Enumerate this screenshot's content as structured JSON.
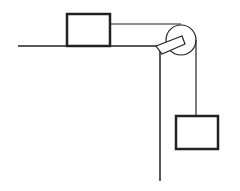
{
  "diagram": {
    "stroke_color": "#222222",
    "background": "#ffffff",
    "table": {
      "surface": {
        "x1": 18,
        "y1": 46,
        "x2": 160,
        "y2": 46
      },
      "edge": {
        "x1": 160,
        "y1": 46,
        "x2": 160,
        "y2": 181
      }
    },
    "block_on_table": {
      "x": 67,
      "y": 14,
      "width": 43,
      "height": 32,
      "stroke_width": 2.5
    },
    "hanging_block": {
      "x": 176,
      "y": 116,
      "width": 42,
      "height": 33,
      "stroke_width": 2.5
    },
    "pulley": {
      "cx": 181,
      "cy": 40,
      "r": 15
    },
    "bracket": {
      "points": "156,46 182,36 185,44 162,54"
    },
    "string": {
      "horizontal": {
        "x1": 110,
        "y1": 24,
        "x2": 181,
        "y2": 24
      },
      "vertical": {
        "x1": 196,
        "y1": 40,
        "x2": 196,
        "y2": 116
      }
    }
  }
}
